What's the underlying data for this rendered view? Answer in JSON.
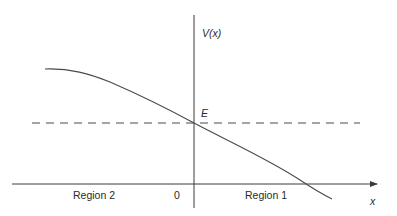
{
  "diagram": {
    "y_axis_label": "V(x)",
    "x_axis_label": "x",
    "energy_label": "E",
    "origin_label": "0",
    "regions": [
      {
        "label": "Region 2"
      },
      {
        "label": "Region 1"
      }
    ],
    "colors": {
      "axis": "#3a3a3a",
      "curve": "#4a4a4a",
      "dashed_line": "#4a4a4a",
      "background": "#ffffff"
    },
    "geometry": {
      "v_axis": {
        "x": 194,
        "y1": 15,
        "y2": 208
      },
      "h_axis": {
        "y": 184,
        "x1": 12,
        "x2": 377
      },
      "energy_line": {
        "y": 123,
        "x1": 32,
        "x2": 360
      },
      "curve_path": "M 45 69 C 70 68, 90 74, 110 82 C 140 95, 170 110, 194 123 C 230 142, 270 160, 300 180 C 312 188, 322 194, 332 199"
    }
  }
}
